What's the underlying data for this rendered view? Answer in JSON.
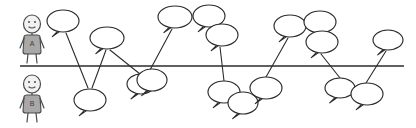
{
  "diagram": {
    "type": "hand-drawn-sketch",
    "canvas": {
      "width": 416,
      "height": 128,
      "background": "#ffffff"
    },
    "ink_color": "#2b2b2b",
    "figure_fill": "#a8a8a8",
    "axis": {
      "name": "timeline-axis",
      "y": 66,
      "x_start": 20,
      "x_end": 404,
      "color": "#2b2b2b"
    },
    "speakers": [
      {
        "id": "speaker-a",
        "label": "A",
        "position": "above-line",
        "cx": 32,
        "head_cy": 24,
        "torso_top": 33
      },
      {
        "id": "speaker-b",
        "label": "B",
        "position": "below-line",
        "cx": 32,
        "head_cy": 84,
        "torso_top": 93
      }
    ],
    "bubbles": [
      {
        "id": "bubble-1",
        "cx": 63,
        "cy": 21,
        "rx": 16,
        "ry": 11,
        "side": "above",
        "tail": "down-left"
      },
      {
        "id": "bubble-2",
        "cx": 90,
        "cy": 100,
        "rx": 16,
        "ry": 11,
        "side": "below",
        "tail": "down-left"
      },
      {
        "id": "bubble-3",
        "cx": 107,
        "cy": 38,
        "rx": 17,
        "ry": 11,
        "side": "above",
        "tail": "down-left"
      },
      {
        "id": "bubble-4",
        "cx": 141,
        "cy": 84,
        "rx": 14,
        "ry": 10,
        "side": "below",
        "tail": "down-left"
      },
      {
        "id": "bubble-5",
        "cx": 152,
        "cy": 80,
        "rx": 15,
        "ry": 11,
        "side": "below",
        "tail": "down-left"
      },
      {
        "id": "bubble-6",
        "cx": 175,
        "cy": 17,
        "rx": 17,
        "ry": 11,
        "side": "above",
        "tail": "down-left"
      },
      {
        "id": "bubble-7",
        "cx": 209,
        "cy": 16,
        "rx": 16,
        "ry": 11,
        "side": "above",
        "tail": "down-left"
      },
      {
        "id": "bubble-8",
        "cx": 222,
        "cy": 35,
        "rx": 16,
        "ry": 11,
        "side": "above",
        "tail": "down-left"
      },
      {
        "id": "bubble-9",
        "cx": 224,
        "cy": 92,
        "rx": 16,
        "ry": 11,
        "side": "below",
        "tail": "down-left"
      },
      {
        "id": "bubble-10",
        "cx": 243,
        "cy": 103,
        "rx": 15,
        "ry": 11,
        "side": "below",
        "tail": "down-left"
      },
      {
        "id": "bubble-11",
        "cx": 266,
        "cy": 88,
        "rx": 16,
        "ry": 11,
        "side": "below",
        "tail": "down-left"
      },
      {
        "id": "bubble-12",
        "cx": 290,
        "cy": 26,
        "rx": 16,
        "ry": 11,
        "side": "above",
        "tail": "down-left"
      },
      {
        "id": "bubble-13",
        "cx": 320,
        "cy": 22,
        "rx": 16,
        "ry": 11,
        "side": "above",
        "tail": "down-left"
      },
      {
        "id": "bubble-14",
        "cx": 322,
        "cy": 42,
        "rx": 16,
        "ry": 11,
        "side": "above",
        "tail": "down-left"
      },
      {
        "id": "bubble-15",
        "cx": 340,
        "cy": 88,
        "rx": 15,
        "ry": 10,
        "side": "below",
        "tail": "down-left"
      },
      {
        "id": "bubble-16",
        "cx": 367,
        "cy": 94,
        "rx": 16,
        "ry": 11,
        "side": "below",
        "tail": "down-left"
      },
      {
        "id": "bubble-17",
        "cx": 388,
        "cy": 40,
        "rx": 15,
        "ry": 10,
        "side": "above",
        "tail": "down-left"
      }
    ],
    "connectors": [
      {
        "id": "connector-1",
        "x1": 66,
        "y1": 33,
        "x2": 88,
        "y2": 88
      },
      {
        "id": "connector-2",
        "x1": 92,
        "y1": 88,
        "x2": 106,
        "y2": 50
      },
      {
        "id": "connector-3",
        "x1": 110,
        "y1": 50,
        "x2": 140,
        "y2": 74
      },
      {
        "id": "connector-4",
        "x1": 150,
        "y1": 70,
        "x2": 172,
        "y2": 29
      },
      {
        "id": "connector-5",
        "x1": 220,
        "y1": 47,
        "x2": 224,
        "y2": 81
      },
      {
        "id": "connector-6",
        "x1": 266,
        "y1": 77,
        "x2": 288,
        "y2": 38
      },
      {
        "id": "connector-7",
        "x1": 321,
        "y1": 54,
        "x2": 340,
        "y2": 78
      },
      {
        "id": "connector-8",
        "x1": 366,
        "y1": 83,
        "x2": 386,
        "y2": 51
      },
      {
        "id": "connector-9",
        "x1": 209,
        "y1": 28,
        "x2": 209,
        "y2": 28
      },
      {
        "id": "connector-10",
        "x1": 152,
        "y1": 69,
        "x2": 152,
        "y2": 69
      }
    ]
  }
}
